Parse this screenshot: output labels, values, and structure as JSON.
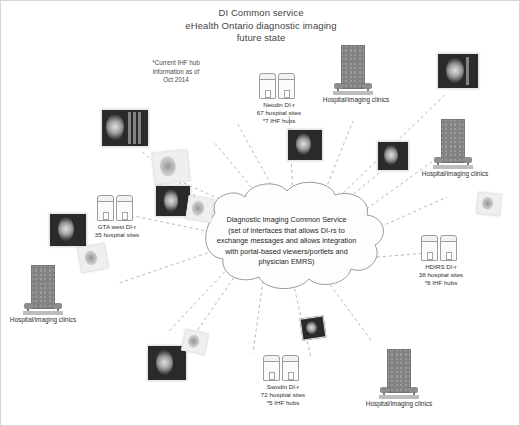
{
  "title": {
    "line1": "DI Common service",
    "line2": "eHealth Ontario diagnostic imaging",
    "line3": "future state"
  },
  "note": {
    "line1": "*Current IHF hub",
    "line2": "information as of",
    "line3": "Oct 2014"
  },
  "center": {
    "line1": "Diagnostic Imaging Common Service",
    "line2": "(set of interfaces that allows DI-rs to",
    "line3": "exchange messages and allows integration",
    "line4": "with portal-based viewers/portlets and",
    "line5": "physician EMRS)"
  },
  "nodes": [
    {
      "id": "neodin",
      "name": "Neodin DI-r",
      "sites": "67 hospital sites",
      "hubs": "*7 IHF hubs"
    },
    {
      "id": "gta-west",
      "name": "GTA west DI-r",
      "sites": "35 hospital sites",
      "hubs": ""
    },
    {
      "id": "hdirs",
      "name": "HDIRS DI-r",
      "sites": "38 hospital sites",
      "hubs": "*8 IHF hubs"
    },
    {
      "id": "swodin",
      "name": "Swodin DI-r",
      "sites": "72 hospital sites",
      "hubs": "*5 IHF hubs"
    }
  ],
  "clinics": [
    {
      "id": "clinic-top-right",
      "label": "Hospital/imaging clinics"
    },
    {
      "id": "clinic-right",
      "label": "Hospital/imaging clinics"
    },
    {
      "id": "clinic-bottom-left",
      "label": "Hospital/imaging clinics"
    },
    {
      "id": "clinic-bottom-right",
      "label": "Hospital/imaging clinics"
    }
  ],
  "colors": {
    "background": "#ffffff",
    "text": "#2e2e2e",
    "title": "#3f3f3f",
    "connector": "#b0b0b0",
    "cloud_stroke": "#9a9a9a",
    "building": "#9a9a9a"
  }
}
